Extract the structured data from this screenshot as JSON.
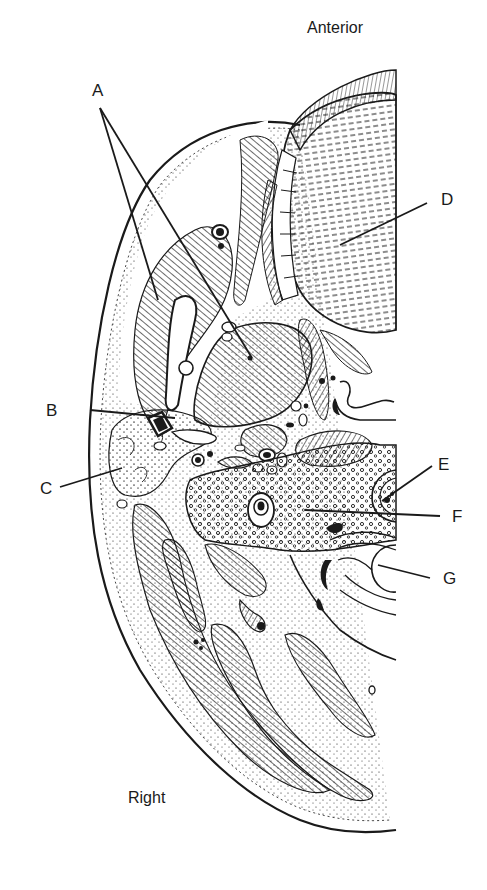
{
  "figure": {
    "type": "anatomical cross-section line drawing",
    "orientation": {
      "top": "Anterior",
      "bottom_left": "Right"
    },
    "labels": [
      {
        "id": "A",
        "text": "A"
      },
      {
        "id": "B",
        "text": "B"
      },
      {
        "id": "C",
        "text": "C"
      },
      {
        "id": "D",
        "text": "D"
      },
      {
        "id": "E",
        "text": "E"
      },
      {
        "id": "F",
        "text": "F"
      },
      {
        "id": "G",
        "text": "G"
      }
    ],
    "colors": {
      "ink": "#1a1a1a",
      "background": "#ffffff"
    }
  }
}
